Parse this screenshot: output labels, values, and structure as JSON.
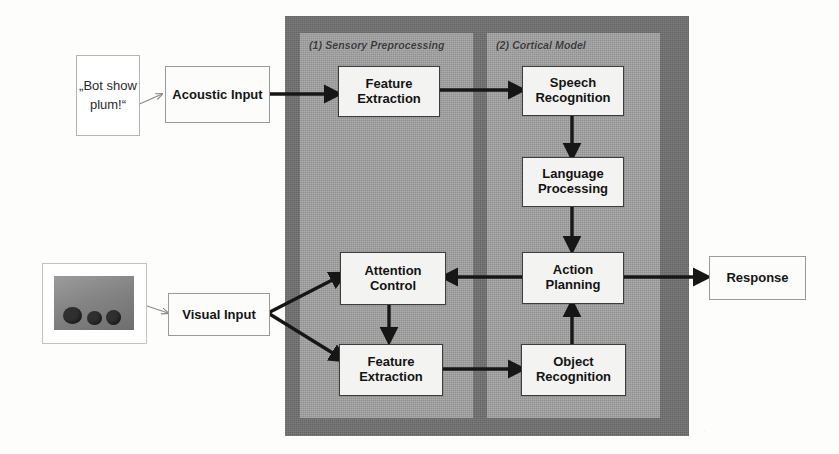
{
  "figure": {
    "background_color": "#fdfdfc",
    "outer_frame_color": "#6f6f6f",
    "panel_color": "#a0a0a0",
    "node_fill": "#f3f3f1",
    "arrow_color": "#161616"
  },
  "panels": [
    {
      "id": "sensory",
      "label": "(1) Sensory Preprocessing"
    },
    {
      "id": "cortical",
      "label": "(2) Cortical Model"
    }
  ],
  "inputs": {
    "speech_bubble": {
      "text": "„Bot show plum!“",
      "lines": [
        "„Bot",
        "show",
        "plum!“"
      ]
    },
    "acoustic": {
      "label": "Acoustic Input",
      "lines": [
        "Acoustic",
        "Input"
      ]
    },
    "visual": {
      "label": "Visual Input",
      "lines": [
        "Visual Input"
      ]
    },
    "scene_thumbnail": {
      "alt": "grayscale photo of three dark objects on a table",
      "object_count": 3
    }
  },
  "nodes": [
    {
      "id": "feature-extraction-audio",
      "panel": "sensory",
      "lines": [
        "Feature",
        "Extraction"
      ]
    },
    {
      "id": "attention-control",
      "panel": "sensory",
      "lines": [
        "Attention",
        "Control"
      ]
    },
    {
      "id": "feature-extraction-visual",
      "panel": "sensory",
      "lines": [
        "Feature",
        "Extraction"
      ]
    },
    {
      "id": "speech-recognition",
      "panel": "cortical",
      "lines": [
        "Speech",
        "Recognition"
      ]
    },
    {
      "id": "language-processing",
      "panel": "cortical",
      "lines": [
        "Language",
        "Processing"
      ]
    },
    {
      "id": "action-planning",
      "panel": "cortical",
      "lines": [
        "Action",
        "Planning"
      ]
    },
    {
      "id": "object-recognition",
      "panel": "cortical",
      "lines": [
        "Object",
        "Recognition"
      ]
    }
  ],
  "outputs": {
    "response": {
      "label": "Response",
      "lines": [
        "Response"
      ]
    }
  },
  "edges": [
    {
      "from": "speech-bubble",
      "to": "acoustic-input",
      "style": "thin"
    },
    {
      "from": "acoustic-input",
      "to": "feature-extraction-audio",
      "style": "bold"
    },
    {
      "from": "feature-extraction-audio",
      "to": "speech-recognition",
      "style": "bold"
    },
    {
      "from": "speech-recognition",
      "to": "language-processing",
      "style": "bold"
    },
    {
      "from": "language-processing",
      "to": "action-planning",
      "style": "bold"
    },
    {
      "from": "action-planning",
      "to": "response",
      "style": "bold"
    },
    {
      "from": "action-planning",
      "to": "attention-control",
      "style": "bold"
    },
    {
      "from": "object-recognition",
      "to": "action-planning",
      "style": "bold"
    },
    {
      "from": "scene-thumbnail",
      "to": "visual-input",
      "style": "thin"
    },
    {
      "from": "visual-input",
      "to": "attention-control",
      "style": "bold"
    },
    {
      "from": "visual-input",
      "to": "feature-extraction-visual",
      "style": "bold"
    },
    {
      "from": "attention-control",
      "to": "feature-extraction-visual",
      "style": "bold"
    },
    {
      "from": "feature-extraction-visual",
      "to": "object-recognition",
      "style": "bold"
    }
  ]
}
